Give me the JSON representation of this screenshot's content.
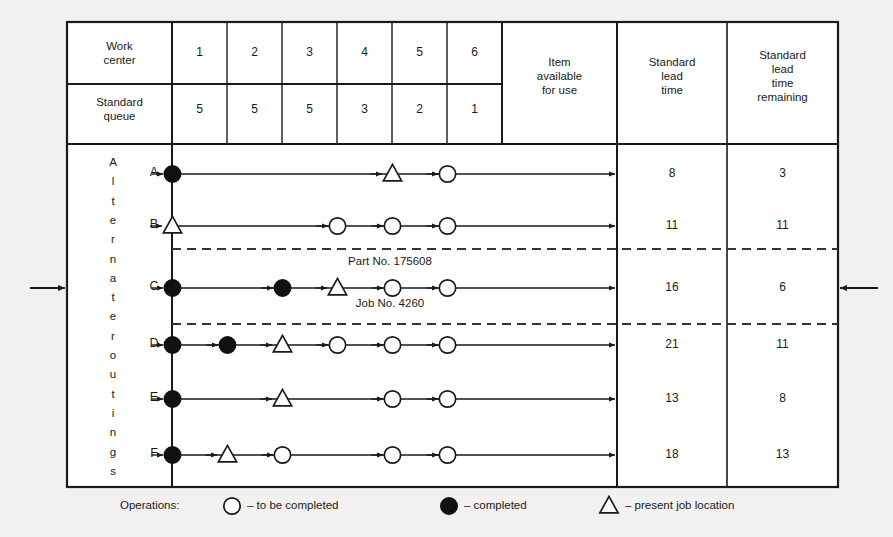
{
  "figure": {
    "title_hidden": "",
    "external_arrows": {
      "left": "arrow-in-left",
      "right": "arrow-in-right"
    }
  },
  "header": {
    "row1_label": "Work\ncenter",
    "row2_label": "Standard\nqueue",
    "work_centers": [
      "1",
      "2",
      "3",
      "4",
      "5",
      "6"
    ],
    "standard_queue": [
      "5",
      "5",
      "5",
      "3",
      "2",
      "1"
    ],
    "item_available": "Item\navailable\nfor use",
    "standard_lead_time": "Standard\nlead\ntime",
    "standard_lead_time_remaining": "Standard\nlead\ntime\nremaining"
  },
  "side_label": {
    "text": "Alternate routings",
    "letters": [
      "A",
      "l",
      "t",
      "e",
      "r",
      "n",
      "a",
      "t",
      "e",
      "r",
      "o",
      "u",
      "t",
      "i",
      "n",
      "g",
      "s"
    ]
  },
  "annotation": {
    "part": "Part No. 175608",
    "job": "Job No. 4260"
  },
  "legend": {
    "title": "Operations:",
    "items": [
      {
        "marker": "open-circle-icon",
        "label": "– to be completed"
      },
      {
        "marker": "filled-circle-icon",
        "label": "– completed"
      },
      {
        "marker": "triangle-icon",
        "label": "– present job location"
      }
    ]
  },
  "chart_data": {
    "type": "table",
    "columns": [
      "Work center 1",
      "Work center 2",
      "Work center 3",
      "Work center 4",
      "Work center 5",
      "Work center 6",
      "Item available for use",
      "Standard lead time",
      "Standard lead time remaining"
    ],
    "standard_queue_by_center": [
      5,
      5,
      5,
      3,
      2,
      1
    ],
    "marker_legend": {
      "open": "to be completed",
      "filled": "completed",
      "triangle": "present job location"
    },
    "rows": [
      {
        "routing": "A",
        "markers": [
          "filled",
          null,
          null,
          null,
          "triangle",
          "open"
        ],
        "standard_lead_time": 8,
        "standard_lead_time_remaining": 3,
        "divider_below": false
      },
      {
        "routing": "B",
        "markers": [
          "triangle",
          null,
          null,
          "open",
          "open",
          "open"
        ],
        "standard_lead_time": 11,
        "standard_lead_time_remaining": 11,
        "divider_below": true
      },
      {
        "routing": "C",
        "markers": [
          "filled",
          null,
          "filled",
          "triangle",
          "open",
          "open"
        ],
        "standard_lead_time": 16,
        "standard_lead_time_remaining": 6,
        "divider_below": true
      },
      {
        "routing": "D",
        "markers": [
          "filled",
          "filled",
          "triangle",
          "open",
          "open",
          "open"
        ],
        "standard_lead_time": 21,
        "standard_lead_time_remaining": 11,
        "divider_below": false
      },
      {
        "routing": "E",
        "markers": [
          "filled",
          null,
          "triangle",
          null,
          "open",
          "open"
        ],
        "standard_lead_time": 13,
        "standard_lead_time_remaining": 8,
        "divider_below": false
      },
      {
        "routing": "F",
        "markers": [
          "filled",
          "triangle",
          "open",
          null,
          "open",
          "open"
        ],
        "standard_lead_time": 18,
        "standard_lead_time_remaining": 13,
        "divider_below": false
      }
    ]
  }
}
